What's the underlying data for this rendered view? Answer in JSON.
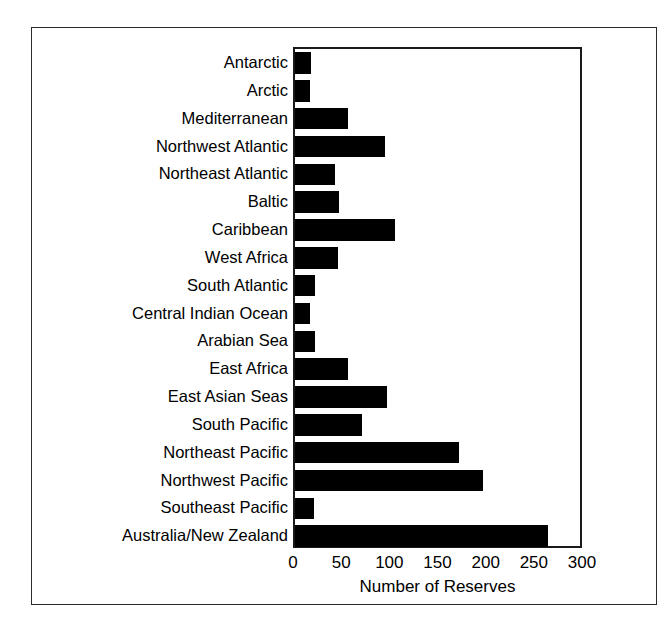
{
  "chart_data": {
    "type": "bar",
    "orientation": "horizontal",
    "title": "",
    "xlabel": "Number of Reserves",
    "ylabel": "",
    "xlim": [
      0,
      300
    ],
    "xticks": [
      0,
      50,
      100,
      150,
      200,
      250,
      300
    ],
    "grid": false,
    "legend": null,
    "bar_color": "#000000",
    "categories": [
      "Antarctic",
      "Arctic",
      "Mediterranean",
      "Northwest Atlantic",
      "Northeast Atlantic",
      "Baltic",
      "Caribbean",
      "West Africa",
      "South Atlantic",
      "Central Indian Ocean",
      "Arabian Sea",
      "East Africa",
      "East Asian Seas",
      "South Pacific",
      "Northeast Pacific",
      "Northwest Pacific",
      "Southeast Pacific",
      "Australia/New Zealand"
    ],
    "values": [
      17,
      16,
      55,
      93,
      42,
      46,
      104,
      45,
      21,
      16,
      21,
      55,
      95,
      70,
      170,
      195,
      20,
      263
    ]
  }
}
